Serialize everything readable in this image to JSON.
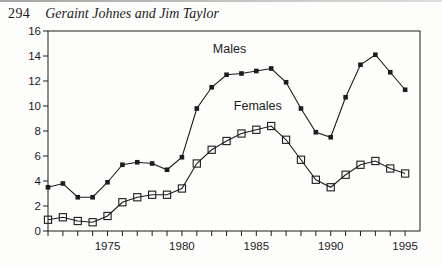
{
  "page": {
    "number": "294",
    "running_title": "Geraint Johnes and Jim Taylor"
  },
  "colors": {
    "ink": "#1c1c1c",
    "paper": "#fdfdfb",
    "scan_edge_left": "#8f8f8f",
    "scan_edge_right": "#d6d6d6"
  },
  "chart_data": {
    "type": "line",
    "title": "",
    "xlabel": "",
    "ylabel": "",
    "x": [
      1971,
      1972,
      1973,
      1974,
      1975,
      1976,
      1977,
      1978,
      1979,
      1980,
      1981,
      1982,
      1983,
      1984,
      1985,
      1986,
      1987,
      1988,
      1989,
      1990,
      1991,
      1992,
      1993,
      1994,
      1995
    ],
    "series": [
      {
        "name": "Males",
        "marker": "filled-square",
        "values": [
          3.5,
          3.8,
          2.7,
          2.7,
          3.9,
          5.3,
          5.5,
          5.4,
          4.9,
          5.9,
          9.8,
          11.5,
          12.5,
          12.6,
          12.8,
          13.0,
          11.9,
          9.8,
          7.9,
          7.5,
          10.7,
          13.3,
          14.1,
          12.7,
          11.3
        ]
      },
      {
        "name": "Females",
        "marker": "open-square",
        "values": [
          0.9,
          1.1,
          0.8,
          0.7,
          1.2,
          2.3,
          2.7,
          2.9,
          2.9,
          3.4,
          5.4,
          6.5,
          7.2,
          7.8,
          8.1,
          8.4,
          7.3,
          5.7,
          4.1,
          3.5,
          4.5,
          5.3,
          5.6,
          5.0,
          4.6
        ]
      }
    ],
    "annotations": [
      {
        "text": "Males",
        "x": 1983.2,
        "y": 14.6
      },
      {
        "text": "Females",
        "x": 1985.1,
        "y": 10.0
      }
    ],
    "xlim": [
      1971,
      1996
    ],
    "ylim": [
      0,
      16
    ],
    "yticks": [
      0,
      2,
      4,
      6,
      8,
      10,
      12,
      14,
      16
    ],
    "xticks_labeled": [
      1975,
      1980,
      1985,
      1990,
      1995
    ],
    "grid": false,
    "legend_position": "inline-annotations"
  }
}
